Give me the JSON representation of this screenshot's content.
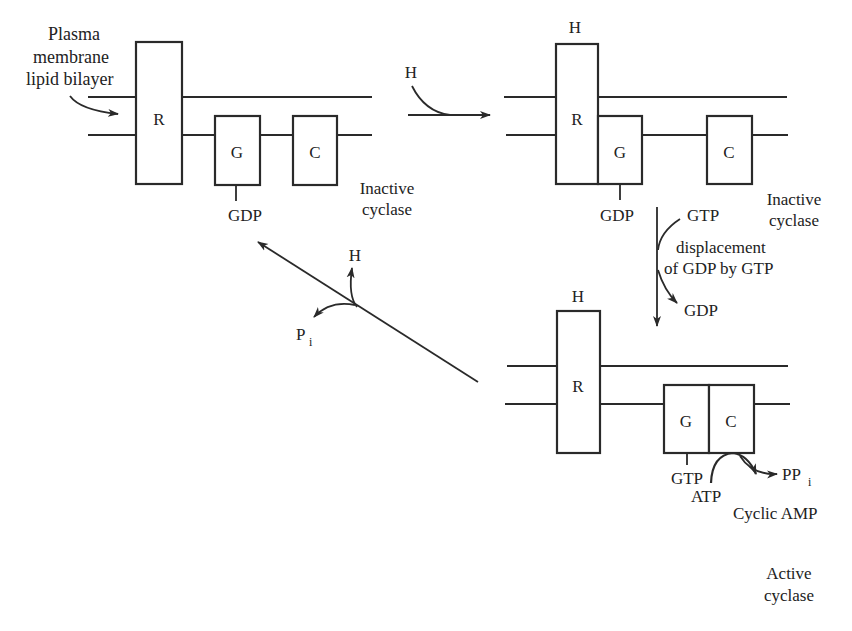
{
  "diagram": {
    "type": "signal-transduction-cycle",
    "components": {
      "receptor": "R",
      "g_protein": "G",
      "cyclase": "C",
      "hormone": "H"
    },
    "panel1": {
      "membrane_label": [
        "Plasma",
        "membrane",
        "lipid bilayer"
      ],
      "receptor": "R",
      "g_protein": "G",
      "cyclase": "C",
      "g_bound": "GDP",
      "state": [
        "Inactive",
        "cyclase"
      ]
    },
    "arrow1": {
      "input": "H"
    },
    "panel2": {
      "hormone": "H",
      "receptor": "R",
      "g_protein": "G",
      "cyclase": "C",
      "g_bound": "GDP",
      "state": [
        "Inactive",
        "cyclase"
      ]
    },
    "arrow2": {
      "input": "GTP",
      "output": "GDP",
      "label": [
        "displacement",
        "of GDP by GTP"
      ]
    },
    "panel3": {
      "hormone": "H",
      "receptor": "R",
      "g_protein": "G",
      "cyclase": "C",
      "g_bound": "GTP",
      "substrate": "ATP",
      "product": "Cyclic AMP",
      "byproduct": "PP",
      "byproduct_sub": "i",
      "state": [
        "Active",
        "cyclase"
      ]
    },
    "arrow3": {
      "release": "H",
      "output": "P",
      "output_sub": "i"
    }
  }
}
